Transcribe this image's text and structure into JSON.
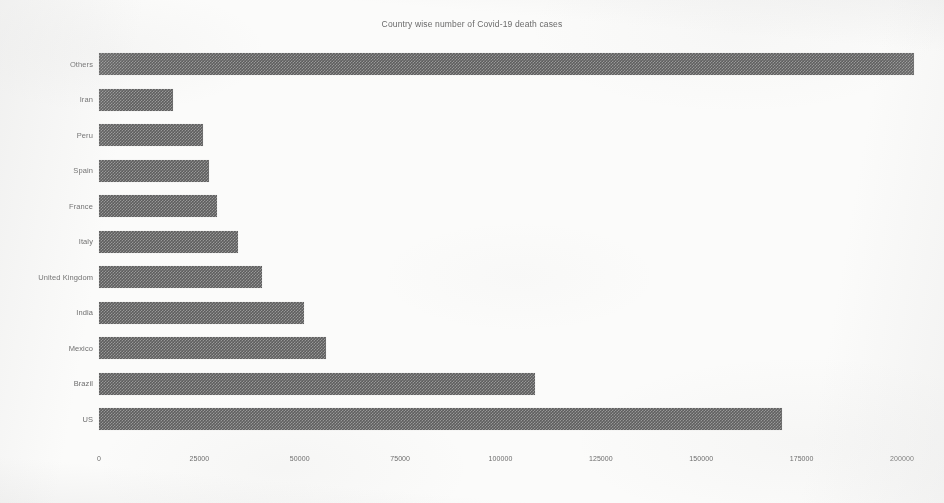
{
  "chart_data": {
    "type": "bar",
    "orientation": "horizontal",
    "title": "Country wise number of Covid-19 death cases",
    "xlabel": "",
    "ylabel": "",
    "grid": false,
    "legend": null,
    "xlim": [
      0,
      200000
    ],
    "xticks": [
      0,
      25000,
      50000,
      75000,
      100000,
      125000,
      150000,
      175000,
      200000
    ],
    "xticklabels": [
      "0",
      "25000",
      "50000",
      "75000",
      "100000",
      "125000",
      "150000",
      "175000",
      "200000"
    ],
    "bar_color": "#5e5e5e",
    "categories": [
      "Others",
      "Iran",
      "Peru",
      "Spain",
      "France",
      "Italy",
      "United Kingdom",
      "India",
      "Mexico",
      "Brazil",
      "US"
    ],
    "values": [
      203000,
      18500,
      26000,
      27500,
      29500,
      34500,
      40500,
      51000,
      56500,
      108500,
      170000
    ]
  },
  "figure": {
    "background": "#fbfbfa"
  }
}
